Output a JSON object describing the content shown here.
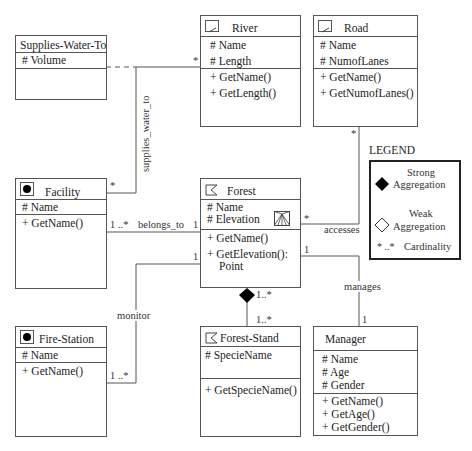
{
  "classes": {
    "supplies": {
      "title": "Supplies-Water-To",
      "attrs": [
        "# Volume"
      ],
      "ops": []
    },
    "river": {
      "title": "River",
      "icon": "line-icon",
      "attrs": [
        "# Name",
        "# Length"
      ],
      "ops": [
        "+ GetName()",
        "+ GetLength()"
      ]
    },
    "road": {
      "title": "Road",
      "icon": "line-icon",
      "attrs": [
        "# Name",
        "# NumofLanes"
      ],
      "ops": [
        "+ GetName()",
        "+ GetNumofLanes()"
      ]
    },
    "facility": {
      "title": "Facility",
      "icon": "point-icon",
      "attrs": [
        "# Name"
      ],
      "ops": [
        "+ GetName()"
      ]
    },
    "forest": {
      "title": "Forest",
      "icon": "polygon-icon",
      "attrs": [
        "# Name",
        "# Elevation"
      ],
      "ops": [
        "+ GetName()",
        "+ GetElevation():",
        "Point"
      ]
    },
    "firestation": {
      "title": "Fire-Station",
      "icon": "point-icon",
      "attrs": [
        "# Name"
      ],
      "ops": [
        "+ GetName()"
      ]
    },
    "foreststand": {
      "title": "Forest-Stand",
      "icon": "polygon-icon",
      "attrs": [
        "# SpecieName"
      ],
      "ops": [
        "+ GetSpecieName()"
      ]
    },
    "manager": {
      "title": "Manager",
      "attrs": [
        "# Name",
        "# Age",
        "# Gender"
      ],
      "ops": [
        "+ GetName()",
        "+ GetAge()",
        "+ GetGender()"
      ]
    }
  },
  "associations": {
    "supplies_water_to": {
      "label": "supplies_water_to",
      "river_mult": "*",
      "facility_mult": "*"
    },
    "belongs_to": {
      "label": "belongs_to",
      "facility_mult": "1 ..*",
      "forest_mult": "1"
    },
    "monitor": {
      "label": "monitor",
      "forest_mult": "1",
      "firestation_mult": "1 ..*"
    },
    "accesses": {
      "label": "accesses",
      "forest_mult": "*",
      "road_mult": "*"
    },
    "manages": {
      "label": "manages",
      "forest_mult": "1",
      "manager_mult": "1"
    },
    "composition": {
      "forest_mult": "1..*",
      "stand_mult": "1..*"
    }
  },
  "legend": {
    "title": "LEGEND",
    "strong_line1": "Strong",
    "strong_line2": "Aggregation",
    "weak_line1": "Weak",
    "weak_line2": "Aggregation",
    "card_symbol": "* ..*",
    "card_label": "Cardinality"
  }
}
